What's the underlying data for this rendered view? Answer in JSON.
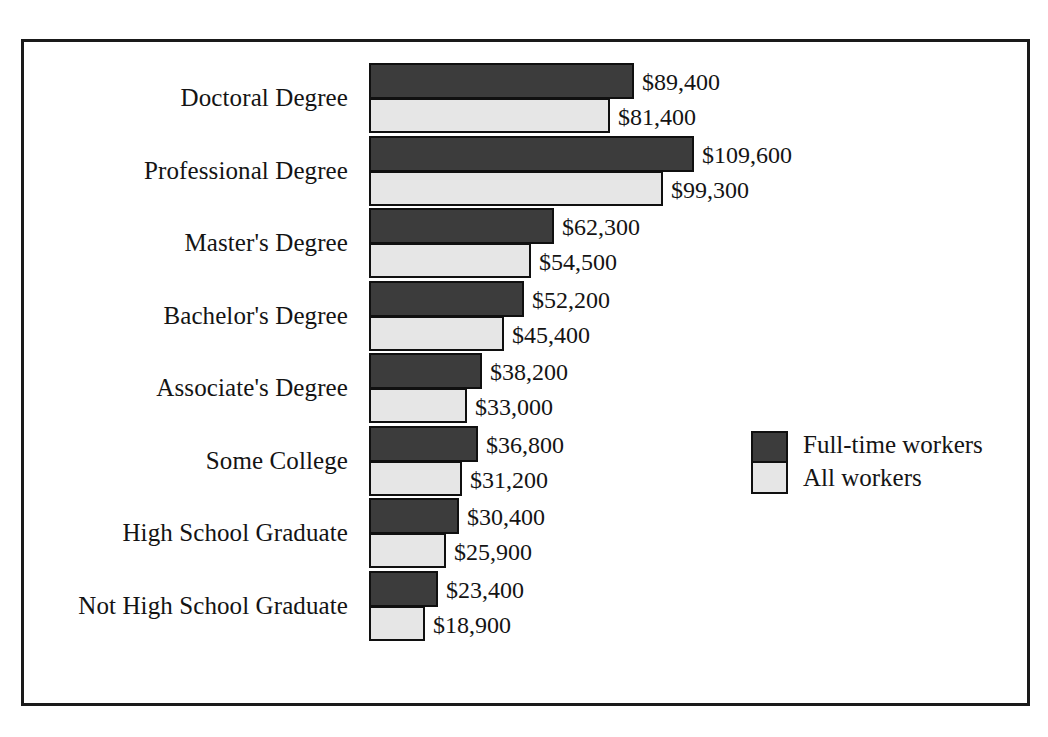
{
  "chart_data": {
    "type": "bar",
    "orientation": "horizontal",
    "title": "",
    "subtitle": "",
    "xlabel": "",
    "ylabel": "",
    "grid": false,
    "legend_position": "right-middle",
    "value_prefix": "$",
    "categories": [
      "Doctoral Degree",
      "Professional Degree",
      "Master's Degree",
      "Bachelor's Degree",
      "Associate's Degree",
      "Some College",
      "High School Graduate",
      "Not High School Graduate"
    ],
    "series": [
      {
        "name": "Full-time workers",
        "color": "#3c3c3c",
        "values": [
          89400,
          109600,
          62300,
          52200,
          38200,
          36800,
          30400,
          23400
        ],
        "labels": [
          "$89,400",
          "$109,600",
          "$62,300",
          "$52,200",
          "$38,200",
          "$36,800",
          "$30,400",
          "$23,400"
        ]
      },
      {
        "name": "All workers",
        "color": "#e6e6e6",
        "values": [
          81400,
          99300,
          54500,
          45400,
          33000,
          31200,
          25900,
          18900
        ],
        "labels": [
          "$81,400",
          "$99,300",
          "$54,500",
          "$45,400",
          "$33,000",
          "$31,200",
          "$25,900",
          "$18,900"
        ]
      }
    ],
    "xlim": [
      0,
      109600
    ],
    "axis_ticks_visible": false
  },
  "legend": {
    "entries": [
      {
        "label": "Full-time workers",
        "color": "#3c3c3c"
      },
      {
        "label": "All workers",
        "color": "#e6e6e6"
      }
    ]
  },
  "frame": {
    "border_color": "#1a1a1a",
    "background": "#ffffff"
  }
}
